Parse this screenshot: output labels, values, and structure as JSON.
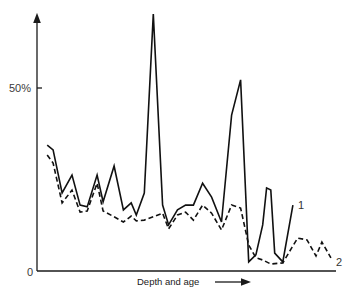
{
  "chart_data": {
    "type": "line",
    "title": "",
    "xlabel": "Depth and age",
    "ylabel": "",
    "x_axis_arrow": true,
    "y_axis_arrow": true,
    "y_unit": "%",
    "ylim": [
      0,
      72
    ],
    "xlim": [
      0,
      100
    ],
    "yticks": [
      {
        "value": 0,
        "label": "0"
      },
      {
        "value": 50,
        "label": "50%"
      }
    ],
    "grid": false,
    "legend": "inline labels at line ends",
    "series": [
      {
        "name": "1",
        "style": "solid",
        "x": [
          3.4,
          5.4,
          8.4,
          11.7,
          14.4,
          16.8,
          20.1,
          22.1,
          25.8,
          28.9,
          31.5,
          33.2,
          35.9,
          38.9,
          42.0,
          44.0,
          47.0,
          49.7,
          52.3,
          55.4,
          58.4,
          61.7,
          65.1,
          68.1,
          70.8,
          73.2,
          75.5,
          76.8,
          78.2,
          79.5,
          82.2,
          85.6
        ],
        "values": [
          34.4,
          33.1,
          21.3,
          26.2,
          18.0,
          17.5,
          26.2,
          18.9,
          28.7,
          16.7,
          18.6,
          15.3,
          21.3,
          70.2,
          18.0,
          12.6,
          16.7,
          18.0,
          18.0,
          24.0,
          20.2,
          13.4,
          42.6,
          52.2,
          2.5,
          4.4,
          12.6,
          22.7,
          22.1,
          4.9,
          2.5,
          18.0
        ]
      },
      {
        "name": "2",
        "style": "dashed",
        "x": [
          3.4,
          5.4,
          8.4,
          11.7,
          14.4,
          16.8,
          20.1,
          22.1,
          25.8,
          28.9,
          31.5,
          33.2,
          35.9,
          38.9,
          42.0,
          44.0,
          47.0,
          49.7,
          52.3,
          55.4,
          58.4,
          61.7,
          65.1,
          68.1,
          70.8,
          73.2,
          75.5,
          78.2,
          82.2,
          85.2,
          87.2,
          90.3,
          93.3,
          95.3,
          98.3
        ],
        "values": [
          31.7,
          29.5,
          18.6,
          22.1,
          16.1,
          16.4,
          24.0,
          16.4,
          14.8,
          13.4,
          15.0,
          13.7,
          13.9,
          14.8,
          15.8,
          11.5,
          15.3,
          16.1,
          13.9,
          18.0,
          15.8,
          11.2,
          18.0,
          17.2,
          7.1,
          3.6,
          3.0,
          1.9,
          2.2,
          6.3,
          9.0,
          8.5,
          4.1,
          7.9,
          3.6
        ]
      }
    ]
  }
}
